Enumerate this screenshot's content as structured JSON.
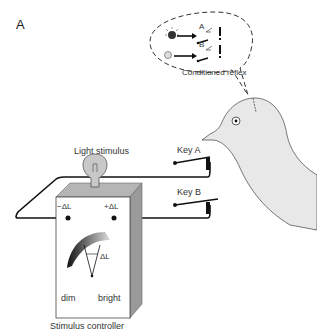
{
  "figure": {
    "panel_label": "A",
    "labels": {
      "light_stimulus": "Light stimulus",
      "key_a": "Key A",
      "key_b": "Key B",
      "minus_dl": "−ΔL",
      "plus_dl": "+ΔL",
      "dial_dl": "ΔL",
      "dim": "dim",
      "bright": "bright",
      "stimulus_controller": "Stimulus controller",
      "conditioned_reflex": "Conditioned reflex",
      "bubble_key_a": "A",
      "bubble_key_b": "B"
    },
    "colors": {
      "line": "#1a1a1a",
      "box_side": "#9a9a9a",
      "box_top": "#b5b5b5",
      "pigeon_fill": "#e8e8e8",
      "bulb_fill": "#c8c8c8"
    }
  }
}
